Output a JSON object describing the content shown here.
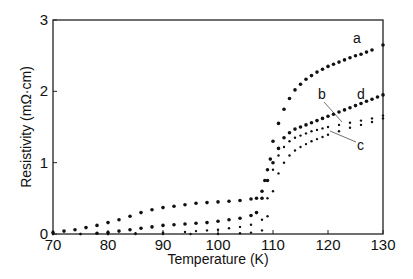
{
  "chart_data": {
    "type": "scatter",
    "title": "",
    "xlabel": "Temperature (K)",
    "ylabel": "Resistivity (mΩ·cm)",
    "xlim": [
      70,
      130
    ],
    "ylim": [
      0,
      3
    ],
    "xticks": [
      70,
      80,
      90,
      100,
      110,
      120,
      130
    ],
    "yticks": [
      0,
      1,
      2,
      3
    ],
    "grid": false,
    "legend": "inline curve labels a, b, c, d",
    "series": [
      {
        "name": "a",
        "marker": "dot-large",
        "x": [
          70,
          72,
          74,
          76,
          78,
          80,
          82,
          84,
          86,
          88,
          90,
          92,
          94,
          96,
          98,
          100,
          102,
          104,
          106,
          107,
          108,
          108.5,
          109,
          109.5,
          110,
          111,
          112,
          113,
          114,
          115,
          116,
          117,
          118,
          119,
          120,
          121,
          122,
          123,
          124,
          125,
          126,
          127,
          128,
          130
        ],
        "y": [
          0.02,
          0.04,
          0.06,
          0.09,
          0.12,
          0.16,
          0.2,
          0.25,
          0.3,
          0.34,
          0.37,
          0.39,
          0.41,
          0.43,
          0.44,
          0.45,
          0.46,
          0.47,
          0.49,
          0.5,
          0.6,
          0.75,
          0.9,
          1.05,
          1.3,
          1.55,
          1.75,
          1.9,
          2.02,
          2.1,
          2.17,
          2.22,
          2.27,
          2.31,
          2.35,
          2.38,
          2.41,
          2.44,
          2.47,
          2.5,
          2.52,
          2.55,
          2.58,
          2.65
        ]
      },
      {
        "name": "d",
        "marker": "dot-large",
        "x": [
          78,
          80,
          82,
          84,
          86,
          88,
          90,
          92,
          94,
          96,
          98,
          100,
          102,
          104,
          106,
          107,
          108,
          109,
          110,
          111,
          112,
          113,
          114,
          115,
          116,
          117,
          118,
          119,
          120,
          121,
          122,
          123,
          124,
          125,
          126,
          127,
          128,
          129,
          130
        ],
        "y": [
          0.01,
          0.02,
          0.04,
          0.06,
          0.08,
          0.1,
          0.12,
          0.13,
          0.14,
          0.15,
          0.16,
          0.18,
          0.2,
          0.22,
          0.26,
          0.3,
          0.5,
          0.75,
          1.0,
          1.2,
          1.35,
          1.42,
          1.47,
          1.5,
          1.53,
          1.56,
          1.59,
          1.62,
          1.65,
          1.68,
          1.71,
          1.74,
          1.77,
          1.8,
          1.83,
          1.86,
          1.89,
          1.92,
          1.95
        ]
      },
      {
        "name": "b",
        "marker": "dot-small",
        "x": [
          70,
          75,
          80,
          85,
          90,
          94,
          96,
          98,
          100,
          102,
          104,
          106,
          108,
          109,
          110,
          111,
          112,
          113,
          114,
          115,
          116,
          117,
          118,
          119,
          120,
          122,
          124,
          126,
          128,
          130
        ],
        "y": [
          0.0,
          0.0,
          0.0,
          0.01,
          0.02,
          0.03,
          0.04,
          0.05,
          0.06,
          0.08,
          0.1,
          0.13,
          0.2,
          0.5,
          0.9,
          1.1,
          1.22,
          1.3,
          1.35,
          1.38,
          1.41,
          1.44,
          1.46,
          1.48,
          1.5,
          1.53,
          1.56,
          1.59,
          1.62,
          1.66
        ]
      },
      {
        "name": "c",
        "marker": "dot-small",
        "x": [
          70,
          75,
          80,
          85,
          90,
          95,
          100,
          104,
          106,
          108,
          109,
          110,
          111,
          112,
          113,
          114,
          115,
          116,
          117,
          118,
          119,
          120,
          122,
          124,
          126,
          128,
          130
        ],
        "y": [
          0.0,
          0.0,
          0.0,
          0.0,
          0.0,
          0.0,
          0.0,
          0.01,
          0.02,
          0.05,
          0.25,
          0.6,
          0.85,
          1.0,
          1.1,
          1.17,
          1.22,
          1.26,
          1.3,
          1.33,
          1.36,
          1.39,
          1.44,
          1.49,
          1.53,
          1.57,
          1.62
        ]
      }
    ],
    "annotations": [
      {
        "text": "a",
        "x": 126,
        "y": 2.75
      },
      {
        "text": "b",
        "x": 119.5,
        "y": 1.95
      },
      {
        "text": "d",
        "x": 126.5,
        "y": 1.95
      },
      {
        "text": "c",
        "x": 126.5,
        "y": 1.25
      }
    ]
  },
  "labels": {
    "xlabel": "Temperature (K)",
    "ylabel": "Resistivity (mΩ·cm)",
    "a": "a",
    "b": "b",
    "c": "c",
    "d": "d"
  }
}
